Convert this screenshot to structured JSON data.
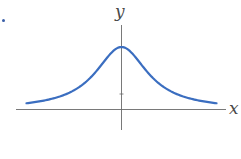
{
  "chart_data": {
    "type": "line",
    "title": "",
    "xlabel": "x",
    "ylabel": "y",
    "series": [
      {
        "name": "curve",
        "color": "#3b6ec0",
        "x": [
          -3,
          -2.5,
          -2,
          -1.5,
          -1,
          -0.5,
          0,
          0.5,
          1,
          1.5,
          2,
          2.5,
          3
        ],
        "y": [
          0.1,
          0.138,
          0.2,
          0.308,
          0.5,
          0.8,
          1.0,
          0.8,
          0.5,
          0.308,
          0.2,
          0.138,
          0.1
        ]
      }
    ],
    "xlim": [
      -3.3,
      3.3
    ],
    "ylim": [
      -0.45,
      1.3
    ],
    "grid": false,
    "legend": null,
    "axis_color": "#555555"
  },
  "labels": {
    "x_axis": "x",
    "y_axis": "y"
  },
  "colors": {
    "curve": "#3b6ec0",
    "axes": "#555555",
    "bullet": "#3a5fa8"
  }
}
